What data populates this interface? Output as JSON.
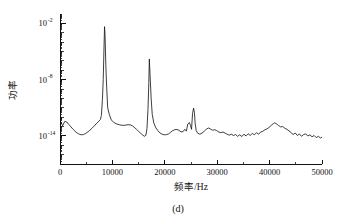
{
  "figure": {
    "caption": "(d)",
    "background_color": "#ffffff",
    "line_color": "#1b1b1b",
    "axis_color": "#111111"
  },
  "chart_data": {
    "type": "line",
    "title": "",
    "subtitle": "",
    "xlabel": "频率/Hz",
    "ylabel": "功率",
    "caption": "(d)",
    "xscale": "linear",
    "yscale": "log",
    "xlim": [
      0,
      50000
    ],
    "ylim": [
      1e-17,
      0.1
    ],
    "grid": false,
    "legend": null,
    "xticks": [
      0,
      10000,
      20000,
      30000,
      40000,
      50000
    ],
    "xticklabels": [
      "0",
      "10000",
      "20000",
      "30000",
      "40000",
      "50000"
    ],
    "yticks": [
      0.01,
      1e-08,
      1e-14
    ],
    "yticklabels": [
      "10⁻²",
      "10⁻⁸",
      "10⁻¹⁴"
    ],
    "ytick_mantissa": [
      "10",
      "10",
      "10"
    ],
    "ytick_exponent": [
      "-2",
      "-8",
      "-14"
    ],
    "yminor_decades": [
      -2,
      -3,
      -4,
      -5,
      -6,
      -7,
      -8,
      -9,
      -10,
      -11,
      -12,
      -13,
      -14,
      -15,
      -16,
      -17
    ],
    "annotations": [
      {
        "label": "fundamental peak",
        "x": 8500,
        "y": 0.0045
      },
      {
        "label": "second harmonic peak",
        "x": 17000,
        "y": 1.6e-06
      },
      {
        "label": "third harmonic peak",
        "x": 25600,
        "y": 9e-12
      },
      {
        "label": "broad noise bump",
        "x": 41000,
        "y": 2.5e-13
      }
    ],
    "series": [
      {
        "name": "power spectrum",
        "x": [
          200,
          500,
          900,
          1300,
          1700,
          2100,
          2500,
          2900,
          3300,
          3700,
          4100,
          4500,
          4900,
          5300,
          5700,
          6100,
          6500,
          6900,
          7300,
          7700,
          7900,
          8100,
          8250,
          8400,
          8500,
          8600,
          8750,
          8900,
          9100,
          9400,
          9800,
          10300,
          10800,
          11400,
          12000,
          12500,
          13000,
          13400,
          13800,
          14200,
          14600,
          15000,
          15400,
          15800,
          16100,
          16400,
          16600,
          16800,
          16950,
          17050,
          17200,
          17400,
          17600,
          17900,
          18300,
          18700,
          19100,
          19500,
          19900,
          20300,
          20700,
          21100,
          21500,
          21900,
          22300,
          22700,
          23100,
          23500,
          23800,
          24100,
          24400,
          24700,
          24900,
          25100,
          25300,
          25500,
          25650,
          25800,
          26000,
          26300,
          26700,
          27100,
          27500,
          27900,
          28300,
          28700,
          29100,
          29500,
          29900,
          30300,
          30700,
          31100,
          31500,
          31900,
          32300,
          32700,
          33100,
          33500,
          33900,
          34300,
          34700,
          35100,
          35500,
          35900,
          36300,
          36700,
          37100,
          37500,
          37900,
          38300,
          38700,
          39100,
          39500,
          39900,
          40300,
          40700,
          41000,
          41300,
          41700,
          42100,
          42500,
          42900,
          43300,
          43700,
          44100,
          44500,
          44900,
          45300,
          45700,
          46100,
          46500,
          46900,
          47300,
          47700,
          48100,
          48500,
          48900,
          49300,
          49700,
          49950
        ],
        "y": [
          3e-13,
          1.2e-13,
          3.5e-13,
          3e-13,
          1.6e-13,
          9e-14,
          5e-14,
          3e-14,
          2e-14,
          1.5e-14,
          1.3e-14,
          1.4e-14,
          1.8e-14,
          2.6e-14,
          4e-14,
          6.5e-14,
          1.1e-13,
          1.9e-13,
          3.2e-13,
          5.5e-13,
          1.5e-12,
          8e-11,
          1e-08,
          3e-05,
          0.0045,
          0.0005,
          3e-07,
          2e-09,
          1e-11,
          2e-12,
          5e-13,
          2.6e-13,
          1.9e-13,
          1.5e-13,
          1.3e-13,
          1.4e-13,
          1.55e-13,
          1.5e-13,
          1.2e-13,
          8e-14,
          5e-14,
          3e-14,
          1.9e-14,
          1.2e-14,
          9e-15,
          1.2e-14,
          6e-14,
          8e-12,
          5e-09,
          1.6e-06,
          2e-08,
          9e-11,
          2e-12,
          2.4e-13,
          7e-14,
          3.4e-14,
          2e-14,
          1.5e-14,
          1.3e-14,
          1.35e-14,
          1.6e-14,
          2.4e-14,
          3.6e-14,
          4.6e-14,
          4.8e-14,
          4e-14,
          2.6e-14,
          2.9e-14,
          5e-14,
          3.2e-14,
          1.9e-13,
          2.6e-13,
          1.3e-13,
          5e-14,
          2.5e-12,
          9e-12,
          3e-12,
          2e-13,
          3.5e-14,
          1.9e-14,
          1.5e-14,
          2e-14,
          3e-14,
          5e-14,
          7e-14,
          5.5e-14,
          4e-14,
          4.6e-14,
          3.6e-14,
          2.6e-14,
          2.2e-14,
          2.6e-14,
          2e-14,
          1.5e-14,
          1.2e-14,
          1.5e-14,
          1.1e-14,
          1.4e-14,
          9e-15,
          1.3e-14,
          8.5e-15,
          1.5e-14,
          1e-14,
          1.7e-14,
          1.1e-14,
          1.8e-14,
          1.3e-14,
          2.2e-14,
          1.5e-14,
          2.6e-14,
          3e-14,
          4.5e-14,
          5.5e-14,
          8e-14,
          1.3e-13,
          2e-13,
          2.5e-13,
          1.9e-13,
          1.3e-13,
          9e-14,
          1e-13,
          6.5e-14,
          5e-14,
          3.4e-14,
          2.2e-14,
          1.4e-14,
          2e-14,
          1.1e-14,
          1.6e-14,
          9e-15,
          1.4e-14,
          1.6e-14,
          1e-14,
          1.3e-14,
          8e-15,
          1.1e-14,
          6.5e-15,
          9e-15,
          6e-15,
          7e-15
        ]
      }
    ]
  }
}
